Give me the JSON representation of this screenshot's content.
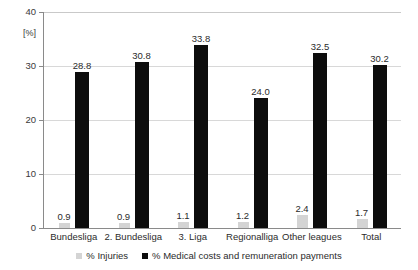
{
  "chart_data": {
    "type": "bar",
    "title": "",
    "xlabel": "",
    "ylabel": "[%]",
    "ylim": [
      0,
      40
    ],
    "yticks": [
      0,
      10,
      20,
      30,
      40
    ],
    "grid": true,
    "legend_position": "bottom",
    "categories": [
      "Bundesliga",
      "2. Bundesliga",
      "3. Liga",
      "Regionalliga",
      "Other leagues",
      "Total"
    ],
    "series": [
      {
        "name": "% Injuries",
        "color": "#d4d4d4",
        "values": [
          0.9,
          0.9,
          1.1,
          1.2,
          2.4,
          1.7
        ],
        "labels": [
          "0.9",
          "0.9",
          "1.1",
          "1.2",
          "2.4",
          "1.7"
        ]
      },
      {
        "name": "% Medical costs and remuneration payments",
        "color": "#0d0d0d",
        "values": [
          28.8,
          30.8,
          33.8,
          24.0,
          32.5,
          30.2
        ],
        "labels": [
          "28.8",
          "30.8",
          "33.8",
          "24.0",
          "32.5",
          "30.2"
        ]
      }
    ]
  },
  "axis": {
    "y_unit": "[%]",
    "tick_labels": [
      "40",
      "30",
      "20",
      "10",
      "0"
    ]
  },
  "legend": {
    "items": [
      {
        "label": "% Injuries",
        "color": "#d4d4d4"
      },
      {
        "label": "% Medical costs and remuneration payments",
        "color": "#0d0d0d"
      }
    ]
  }
}
